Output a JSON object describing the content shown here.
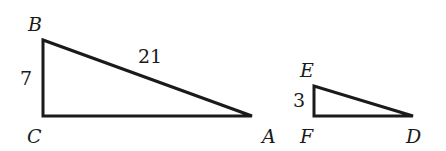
{
  "diagram": {
    "type": "similar-right-triangles",
    "triangles": [
      {
        "name": "triangle-ABC",
        "vertices": {
          "B": {
            "label": "B",
            "x": 43,
            "y": 40
          },
          "C": {
            "label": "C",
            "x": 43,
            "y": 116
          },
          "A": {
            "label": "A",
            "x": 252,
            "y": 116
          }
        },
        "side_labels": {
          "BC": "7",
          "AB": "21"
        }
      },
      {
        "name": "triangle-DEF",
        "vertices": {
          "E": {
            "label": "E",
            "x": 314,
            "y": 86
          },
          "F": {
            "label": "F",
            "x": 314,
            "y": 116
          },
          "D": {
            "label": "D",
            "x": 413,
            "y": 116
          }
        },
        "side_labels": {
          "EF": "3"
        }
      }
    ],
    "stroke_color": "#1a1a1a",
    "background": "#ffffff"
  }
}
